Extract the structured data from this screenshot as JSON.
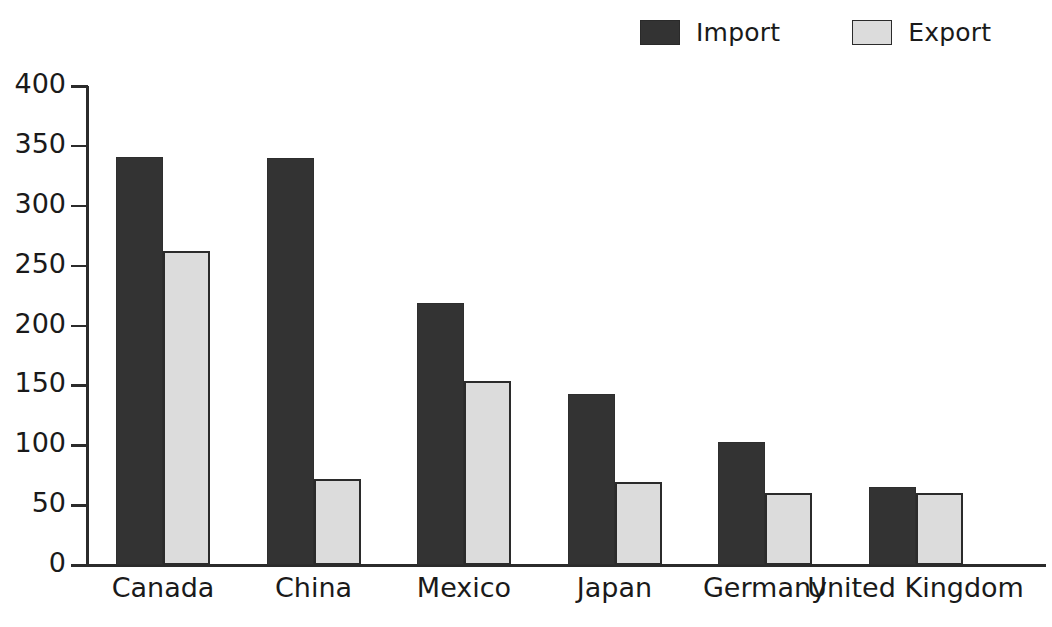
{
  "legend": {
    "position": "top-right",
    "items": [
      {
        "label": "Import",
        "key": "import",
        "color": "#333333",
        "icon": "legend-swatch-icon"
      },
      {
        "label": "Export",
        "key": "export",
        "color": "#dcdcdc",
        "icon": "legend-swatch-icon"
      }
    ]
  },
  "chart_data": {
    "type": "bar",
    "title": "",
    "subtitle": "",
    "xlabel": "",
    "ylabel": "",
    "categories": [
      "Canada",
      "China",
      "Mexico",
      "Japan",
      "Germany",
      "United Kingdom"
    ],
    "series": [
      {
        "name": "Import",
        "color": "#333333",
        "values": [
          341,
          340,
          219,
          143,
          103,
          65
        ]
      },
      {
        "name": "Export",
        "color": "#dcdcdc",
        "values": [
          262,
          72,
          154,
          69,
          60,
          60
        ]
      }
    ],
    "ylim": [
      0,
      400
    ],
    "ytick_values": [
      0,
      50,
      100,
      150,
      200,
      250,
      300,
      350,
      400
    ],
    "ytick_labels": [
      "0",
      "50",
      "100",
      "150",
      "200",
      "250",
      "300",
      "350",
      "400"
    ],
    "grid": false,
    "legend_position": "top-right",
    "annotations": []
  },
  "axes": {
    "y_axis_name": "y-axis",
    "x_axis_name": "x-axis"
  }
}
